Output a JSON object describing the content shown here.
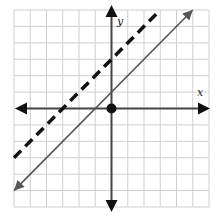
{
  "chart_data": {
    "type": "line",
    "title": "",
    "xlabel": "x",
    "ylabel": "y",
    "xlim": [
      -6,
      6
    ],
    "ylim": [
      -6,
      6
    ],
    "grid": true,
    "grid_step": 1,
    "legend": null,
    "series": [
      {
        "name": "solid line",
        "equation": "y = x + 1",
        "style": "solid",
        "color": "#555555",
        "arrows": "both",
        "points": [
          [
            -6,
            -5
          ],
          [
            5,
            6
          ]
        ]
      },
      {
        "name": "dashed line",
        "equation": "y = x + 3",
        "style": "dashed",
        "color": "#111111",
        "arrows": "none",
        "points": [
          [
            -6,
            -3
          ],
          [
            3,
            6
          ]
        ]
      }
    ],
    "annotations": [
      {
        "type": "point",
        "x": 0,
        "y": 0,
        "style": "filled-circle",
        "color": "#111111"
      }
    ]
  },
  "axes": {
    "x_label": "x",
    "y_label": "y"
  },
  "colors": {
    "grid": "#cfcfcf",
    "axis": "#444444",
    "solid_line": "#555555",
    "dashed_line": "#111111",
    "point": "#111111"
  }
}
